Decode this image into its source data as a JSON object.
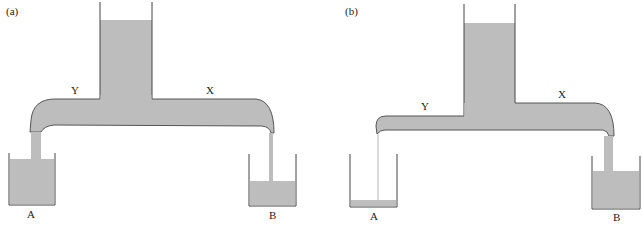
{
  "colors": {
    "liquid": "#bdbdbd",
    "outline": "#444444",
    "background": "#ffffff"
  },
  "panels": [
    {
      "id": "a",
      "label": "(a)",
      "arms": {
        "left": "Y",
        "right": "X"
      },
      "beakers": {
        "left": "A",
        "right": "B"
      },
      "description": "T-shaped siphon; reservoir A high level, B low level; both outlets flowing"
    },
    {
      "id": "b",
      "label": "(b)",
      "arms": {
        "left": "Y",
        "right": "X"
      },
      "beakers": {
        "left": "A",
        "right": "B"
      },
      "description": "T-shaped siphon; left arm Y higher; thin stream into nearly empty A; thick stream into B with high level"
    }
  ]
}
